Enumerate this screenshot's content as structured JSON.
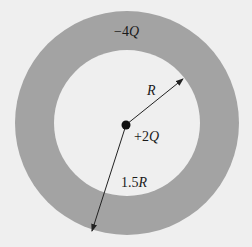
{
  "diagram": {
    "shell": {
      "charge_label": "−4Q",
      "charge_sign": "−4",
      "charge_symbol": "Q",
      "outer_radius_label": "1.5R",
      "outer_radius_num": "1.5",
      "outer_radius_symbol": "R",
      "inner_radius_label": "R",
      "color": "#a3a3a3"
    },
    "point_charge": {
      "label": "+2Q",
      "label_sign": "+2",
      "label_symbol": "Q",
      "color": "#111111"
    },
    "background_color": "#efefef"
  }
}
